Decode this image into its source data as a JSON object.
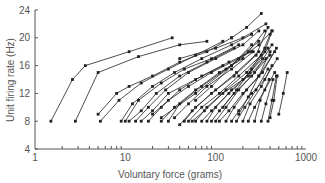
{
  "chart_data": {
    "type": "line",
    "title": "",
    "xlabel": "Voluntary force (grams)",
    "ylabel": "Unit firing rate (Hz)",
    "xscale": "log",
    "xlim": [
      1,
      1000
    ],
    "ylim": [
      4,
      24
    ],
    "xticks": [
      1,
      10,
      100,
      1000
    ],
    "xtick_labels": [
      "1",
      "10",
      "100",
      "1000"
    ],
    "yticks": [
      4,
      8,
      12,
      16,
      20,
      24
    ],
    "ytick_labels": [
      "4",
      "8",
      "12",
      "16",
      "20",
      "24"
    ],
    "grid": false,
    "legend": null,
    "marker": "square",
    "line_color": "#222222",
    "axis_color": "#555555",
    "series": [
      {
        "name": "unit 1",
        "x": [
          1.5,
          2.6,
          3.6,
          11,
          33
        ],
        "y": [
          8,
          14,
          16,
          18,
          20
        ]
      },
      {
        "name": "unit 2",
        "x": [
          2.8,
          5.0,
          14,
          40,
          80
        ],
        "y": [
          8,
          15,
          17.3,
          19,
          19.5
        ]
      },
      {
        "name": "unit 3",
        "x": [
          5.0,
          8.0,
          11,
          20,
          40,
          80,
          150
        ],
        "y": [
          9,
          12,
          13,
          14.5,
          16.5,
          18,
          20
        ]
      },
      {
        "name": "unit 4",
        "x": [
          5.3,
          8.5,
          15,
          30,
          60,
          120
        ],
        "y": [
          8,
          11,
          13.5,
          15.5,
          17.5,
          19.5
        ]
      },
      {
        "name": "unit 5",
        "x": [
          9,
          12,
          20,
          35,
          70,
          150,
          250
        ],
        "y": [
          8,
          10.5,
          13,
          15,
          17,
          19,
          20.5
        ]
      },
      {
        "name": "unit 6",
        "x": [
          10,
          14,
          25,
          45,
          90,
          180
        ],
        "y": [
          8,
          11,
          13.5,
          15.5,
          17,
          19
        ]
      },
      {
        "name": "unit 7",
        "x": [
          11,
          15,
          22,
          40,
          80,
          160
        ],
        "y": [
          8,
          9.5,
          12,
          14.5,
          16.5,
          18.5
        ]
      },
      {
        "name": "unit 8",
        "x": [
          13,
          18,
          28,
          50,
          100,
          200,
          300
        ],
        "y": [
          8,
          10,
          12.5,
          15,
          17,
          19,
          21
        ]
      },
      {
        "name": "unit 9",
        "x": [
          15,
          20,
          30,
          60,
          120
        ],
        "y": [
          8,
          9.5,
          12,
          14,
          16
        ]
      },
      {
        "name": "unit 10",
        "x": [
          18,
          25,
          40,
          70,
          140,
          250
        ],
        "y": [
          8,
          10,
          12.5,
          14.5,
          16.5,
          18
        ]
      },
      {
        "name": "unit 11",
        "x": [
          20,
          30,
          50,
          90,
          180,
          300
        ],
        "y": [
          9,
          11,
          13,
          15,
          17,
          19.5
        ]
      },
      {
        "name": "unit 12",
        "x": [
          25,
          35,
          60,
          110,
          200
        ],
        "y": [
          8,
          10,
          12.5,
          15,
          17
        ]
      },
      {
        "name": "unit 13",
        "x": [
          30,
          40,
          70,
          130,
          230,
          350
        ],
        "y": [
          8,
          10.5,
          13,
          15.5,
          18,
          21
        ]
      },
      {
        "name": "unit 14",
        "x": [
          35,
          50,
          80,
          150,
          260
        ],
        "y": [
          8.5,
          10.5,
          13,
          15.5,
          18
        ]
      },
      {
        "name": "unit 15",
        "x": [
          40,
          55,
          90,
          160,
          280,
          380
        ],
        "y": [
          7.5,
          9.5,
          12,
          14.5,
          17.5,
          21.5
        ]
      },
      {
        "name": "unit 16",
        "x": [
          45,
          60,
          100,
          170,
          300
        ],
        "y": [
          8,
          10,
          12.5,
          15,
          18
        ]
      },
      {
        "name": "unit 17",
        "x": [
          50,
          70,
          110,
          180,
          320,
          400
        ],
        "y": [
          8,
          10,
          12,
          14.5,
          17.5,
          20.5
        ]
      },
      {
        "name": "unit 18",
        "x": [
          55,
          75,
          120,
          200,
          330
        ],
        "y": [
          8,
          9.5,
          12,
          14,
          17
        ]
      },
      {
        "name": "unit 19",
        "x": [
          60,
          80,
          130,
          220,
          350,
          420
        ],
        "y": [
          8,
          10,
          12.5,
          15,
          18,
          21
        ]
      },
      {
        "name": "unit 20",
        "x": [
          70,
          90,
          140,
          230,
          360
        ],
        "y": [
          8,
          9.5,
          12,
          14.5,
          17
        ]
      },
      {
        "name": "unit 21",
        "x": [
          80,
          100,
          150,
          240,
          380
        ],
        "y": [
          8,
          10,
          12.5,
          15,
          18.5
        ]
      },
      {
        "name": "unit 22",
        "x": [
          90,
          110,
          160,
          250,
          400
        ],
        "y": [
          8,
          9.5,
          12,
          14.5,
          17.5
        ]
      },
      {
        "name": "unit 23",
        "x": [
          100,
          130,
          180,
          270,
          420
        ],
        "y": [
          8,
          10,
          12.5,
          15,
          19
        ]
      },
      {
        "name": "unit 24",
        "x": [
          110,
          140,
          200,
          300,
          450
        ],
        "y": [
          8,
          9.5,
          12,
          14.5,
          18
        ]
      },
      {
        "name": "unit 25",
        "x": [
          130,
          160,
          220,
          330,
          470
        ],
        "y": [
          8,
          10,
          12.5,
          15,
          18.5
        ]
      },
      {
        "name": "unit 26",
        "x": [
          150,
          180,
          250,
          350,
          480
        ],
        "y": [
          8,
          9.5,
          12,
          14,
          17
        ]
      },
      {
        "name": "unit 27",
        "x": [
          170,
          210,
          280,
          380
        ],
        "y": [
          8,
          10,
          12.5,
          15.5
        ]
      },
      {
        "name": "unit 28",
        "x": [
          200,
          240,
          320,
          420
        ],
        "y": [
          8,
          10.5,
          13,
          16
        ]
      },
      {
        "name": "unit 29",
        "x": [
          230,
          270,
          350,
          450
        ],
        "y": [
          8,
          10,
          12.5,
          15
        ]
      },
      {
        "name": "unit 30",
        "x": [
          270,
          310,
          390
        ],
        "y": [
          8,
          11,
          14
        ]
      },
      {
        "name": "unit 31",
        "x": [
          320,
          360,
          430
        ],
        "y": [
          8,
          10.5,
          14
        ]
      },
      {
        "name": "unit 32",
        "x": [
          380,
          420,
          470
        ],
        "y": [
          8,
          11,
          14.5
        ]
      },
      {
        "name": "unit 33",
        "x": [
          400,
          440,
          480
        ],
        "y": [
          8.5,
          11,
          14.5
        ]
      },
      {
        "name": "unit 34",
        "x": [
          500,
          560,
          620
        ],
        "y": [
          9,
          12,
          15
        ]
      },
      {
        "name": "unit 35",
        "x": [
          150,
          220,
          320
        ],
        "y": [
          20,
          21.5,
          23.5
        ]
      },
      {
        "name": "unit 36",
        "x": [
          40,
          100,
          200,
          360
        ],
        "y": [
          17,
          18.5,
          20,
          22
        ]
      },
      {
        "name": "unit 37",
        "x": [
          25,
          60,
          150,
          300,
          420
        ],
        "y": [
          8.5,
          12,
          16,
          19,
          21
        ]
      },
      {
        "name": "unit 38",
        "x": [
          60,
          90,
          150,
          250
        ],
        "y": [
          11,
          13,
          16,
          19
        ]
      },
      {
        "name": "unit 39",
        "x": [
          120,
          170,
          250,
          350
        ],
        "y": [
          10,
          12.5,
          15.5,
          18.5
        ]
      },
      {
        "name": "unit 40",
        "x": [
          180,
          230,
          300,
          400
        ],
        "y": [
          9,
          11.5,
          14.5,
          18
        ]
      }
    ]
  },
  "axes": {
    "x_label": "Voluntary force (grams)",
    "y_label": "Unit firing rate (Hz)"
  }
}
